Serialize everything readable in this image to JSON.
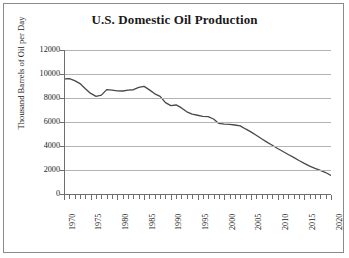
{
  "chart_data": {
    "type": "line",
    "title": "U.S. Domestic Oil Production",
    "xlabel": "",
    "ylabel": "Thousand Barrels of Oil per Day",
    "xlim": [
      1970,
      2020
    ],
    "ylim": [
      0,
      12000
    ],
    "grid": true,
    "legend": null,
    "line_color": "#4a4a4a",
    "grid_color": "#b3b3b3",
    "axis_color": "#6e6e6e",
    "y_ticks": [
      0,
      2000,
      4000,
      6000,
      8000,
      10000,
      12000
    ],
    "y_tick_labels": [
      "0",
      "2000",
      "4000",
      "6000",
      "8000",
      "10000",
      "12000"
    ],
    "x_tick_labels": [
      "1970",
      "1975",
      "1980",
      "1985",
      "1990",
      "1995",
      "2000",
      "2005",
      "2010",
      "2015",
      "2020"
    ],
    "x_tick_step": 1,
    "x_label_step": 5,
    "series": [
      {
        "name": "U.S. Domestic Oil Production",
        "x": [
          1970,
          1971,
          1972,
          1973,
          1974,
          1975,
          1976,
          1977,
          1978,
          1979,
          1980,
          1981,
          1982,
          1983,
          1984,
          1985,
          1986,
          1987,
          1988,
          1989,
          1990,
          1991,
          1992,
          1993,
          1994,
          1995,
          1996,
          1997,
          1998,
          1999,
          2000,
          2001,
          2002,
          2003,
          2004,
          2005,
          2006,
          2007,
          2008,
          2009,
          2010,
          2011,
          2012,
          2013,
          2014,
          2015,
          2016,
          2017,
          2018,
          2019,
          2020
        ],
        "values": [
          9590,
          9620,
          9450,
          9200,
          8780,
          8380,
          8130,
          8240,
          8700,
          8650,
          8600,
          8580,
          8650,
          8690,
          8880,
          8970,
          8680,
          8350,
          8140,
          7610,
          7360,
          7420,
          7170,
          6850,
          6660,
          6560,
          6470,
          6450,
          6250,
          5880,
          5820,
          5800,
          5750,
          5680,
          5420,
          5180,
          4900,
          4600,
          4320,
          4060,
          3790,
          3540,
          3290,
          3050,
          2790,
          2550,
          2330,
          2130,
          1960,
          1790,
          1550
        ]
      }
    ]
  }
}
